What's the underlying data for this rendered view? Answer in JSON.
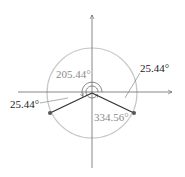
{
  "diagram": {
    "type": "unit-circle-angles",
    "labels": {
      "angle_large_left": "205.44°",
      "angle_large_right": "334.56°",
      "reference_right": "25.44°",
      "reference_left": "25.44°"
    },
    "colors": {
      "circle": "#c8c8c8",
      "axes": "#555555",
      "terminal_sides": "#333333",
      "gray_label": "#8a8a8a",
      "black_label": "#1a1a1a"
    },
    "angles_deg": {
      "terminal_left": 205.44,
      "terminal_right": 334.56
    }
  }
}
